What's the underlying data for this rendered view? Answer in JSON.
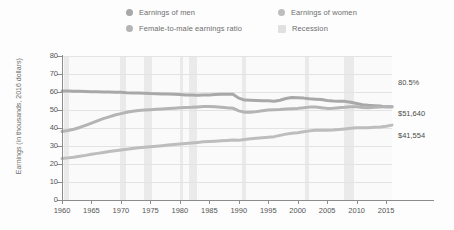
{
  "chart_data": {
    "type": "line",
    "title": "",
    "xlabel": "",
    "ylabel": "Earnings (in thousands, 2016 dollars)",
    "xlim": [
      1960,
      2016
    ],
    "ylim": [
      0,
      80
    ],
    "grid": true,
    "legend_position": "top",
    "x": [
      1960,
      1961,
      1962,
      1963,
      1964,
      1965,
      1966,
      1967,
      1968,
      1969,
      1970,
      1971,
      1972,
      1973,
      1974,
      1975,
      1976,
      1977,
      1978,
      1979,
      1980,
      1981,
      1982,
      1983,
      1984,
      1985,
      1986,
      1987,
      1988,
      1989,
      1990,
      1991,
      1992,
      1993,
      1994,
      1995,
      1996,
      1997,
      1998,
      1999,
      2000,
      2001,
      2002,
      2003,
      2004,
      2005,
      2006,
      2007,
      2008,
      2009,
      2010,
      2011,
      2012,
      2013,
      2014,
      2015,
      2016
    ],
    "series": [
      {
        "name": "Earnings of men",
        "values": [
          60.5,
          60.6,
          60.4,
          60.4,
          60.3,
          60.2,
          60.1,
          60.0,
          60.0,
          59.9,
          59.8,
          59.6,
          59.5,
          59.4,
          59.3,
          59.1,
          59.0,
          58.9,
          58.9,
          58.8,
          58.6,
          58.4,
          58.3,
          58.2,
          58.3,
          58.4,
          58.6,
          58.7,
          58.8,
          58.8,
          56.6,
          55.5,
          55.4,
          55.3,
          55.2,
          55.1,
          54.9,
          55.4,
          56.4,
          56.9,
          56.8,
          56.6,
          56.2,
          56.0,
          55.8,
          55.3,
          55.0,
          54.9,
          54.8,
          54.3,
          53.6,
          52.9,
          52.6,
          52.4,
          52.2,
          51.6,
          51.6
        ],
        "end_label": "$51,640"
      },
      {
        "name": "Female-to-male earnings ratio",
        "values": [
          38.0,
          38.6,
          39.3,
          40.3,
          41.5,
          42.7,
          44.0,
          45.2,
          46.2,
          47.2,
          48.0,
          48.7,
          49.3,
          49.7,
          50.0,
          50.2,
          50.4,
          50.6,
          50.8,
          51.0,
          51.2,
          51.4,
          51.5,
          51.7,
          51.9,
          51.9,
          51.8,
          51.5,
          51.2,
          51.0,
          49.5,
          48.8,
          48.7,
          49.1,
          49.6,
          50.0,
          50.2,
          50.3,
          50.5,
          50.7,
          50.9,
          51.2,
          51.6,
          51.7,
          51.3,
          50.9,
          51.0,
          51.3,
          51.5,
          51.8,
          51.8,
          51.4,
          51.2,
          51.5,
          51.6,
          51.9,
          52.0
        ],
        "end_label": "80.5%"
      },
      {
        "name": "Earnings of women",
        "values": [
          23.0,
          23.4,
          23.8,
          24.3,
          24.8,
          25.4,
          25.9,
          26.4,
          26.9,
          27.4,
          27.8,
          28.2,
          28.6,
          29.0,
          29.3,
          29.6,
          29.9,
          30.2,
          30.5,
          30.8,
          31.1,
          31.4,
          31.7,
          32.0,
          32.3,
          32.5,
          32.7,
          32.9,
          33.1,
          33.3,
          33.2,
          33.6,
          34.0,
          34.3,
          34.6,
          34.9,
          35.2,
          35.9,
          36.6,
          37.1,
          37.4,
          37.9,
          38.4,
          38.7,
          38.8,
          38.8,
          38.9,
          39.2,
          39.5,
          39.8,
          40.1,
          40.1,
          40.2,
          40.4,
          40.6,
          41.0,
          41.6
        ],
        "end_label": "$41,554"
      }
    ],
    "recessions": [
      {
        "start": 1960.3,
        "end": 1961.2
      },
      {
        "start": 1969.9,
        "end": 1970.9
      },
      {
        "start": 1973.9,
        "end": 1975.2
      },
      {
        "start": 1980.0,
        "end": 1980.6
      },
      {
        "start": 1981.5,
        "end": 1982.9
      },
      {
        "start": 1990.6,
        "end": 1991.2
      },
      {
        "start": 2001.2,
        "end": 2001.9
      },
      {
        "start": 2007.9,
        "end": 2009.5
      }
    ],
    "yticks": [
      0,
      10,
      20,
      30,
      40,
      50,
      60,
      70,
      80
    ],
    "xticks": [
      1960,
      1965,
      1970,
      1975,
      1980,
      1985,
      1990,
      1995,
      2000,
      2005,
      2010,
      2015
    ],
    "colors": {
      "men_line": "#a8a8a8",
      "ratio_line": "#b4b4b4",
      "women_line": "#bdbdbd",
      "recession_band": "#e6e6e6",
      "gridline": "#e3e3e3",
      "axis": "#8c8c8c",
      "text": "#6e6e6e"
    }
  },
  "legend": {
    "items": [
      {
        "label": "Earnings of men",
        "marker": "circle",
        "color": "#a8a8a8"
      },
      {
        "label": "Earnings of women",
        "marker": "circle",
        "color": "#bdbdbd"
      },
      {
        "label": "Female-to-male earnings ratio",
        "marker": "circle",
        "color": "#b4b4b4"
      },
      {
        "label": "Recession",
        "marker": "square",
        "color": "#e0e0e0"
      }
    ]
  },
  "end_labels": {
    "ratio": "80.5%",
    "men": "$51,640",
    "women": "$41,554"
  }
}
